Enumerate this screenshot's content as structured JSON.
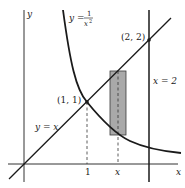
{
  "diagram": {
    "axes": {
      "x_label": "x",
      "y_label": "y"
    },
    "curves": {
      "line_label_lhs": "y = x",
      "hyperbola_label_lhs": "y =",
      "hyperbola_num": "1",
      "hyperbola_den": "x",
      "hyperbola_den_exp": "2",
      "vertical_line_label": "x = 2"
    },
    "points": {
      "p1_label": "(1, 1)",
      "p2_label": "(2, 2)"
    },
    "ticks": {
      "one": "1",
      "x": "x"
    },
    "colors": {
      "curve": "#1a1a1a",
      "rect_fill": "#a9a9a9",
      "rect_stroke": "#3a3a3a"
    }
  }
}
